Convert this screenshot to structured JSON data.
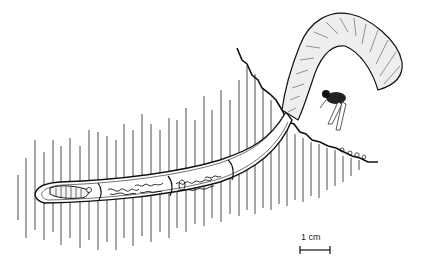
{
  "figure": {
    "scale_bar": {
      "label": "1 cm"
    },
    "colors": {
      "ink": "#1a1a1a",
      "background": "#ffffff"
    }
  }
}
